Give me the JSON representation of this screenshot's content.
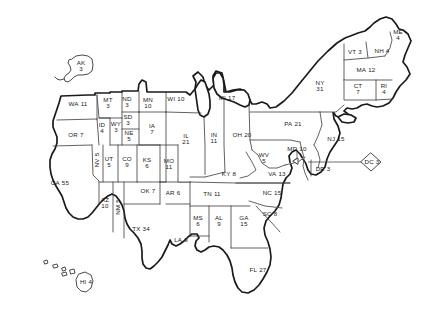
{
  "map": {
    "title": "United States Electoral Votes Map",
    "total_label": "",
    "background_color": "#ffffff",
    "outline_color": "#1a1a1a",
    "border_color": "#3a3a3a",
    "text_color": "#1a1a1a"
  },
  "chart_data": {
    "type": "map",
    "value_field": "electoral_votes",
    "regions": [
      {
        "abbr": "AK",
        "votes": 3,
        "x": 81,
        "y": 66,
        "orient": "stack",
        "inset": true
      },
      {
        "abbr": "HI",
        "votes": 4,
        "x": 86,
        "y": 282,
        "orient": "inline",
        "inset": true
      },
      {
        "abbr": "WA",
        "votes": 11,
        "x": 78,
        "y": 104,
        "orient": "inline",
        "inset": false
      },
      {
        "abbr": "OR",
        "votes": 7,
        "x": 76,
        "y": 135,
        "orient": "inline",
        "inset": false
      },
      {
        "abbr": "CA",
        "votes": 55,
        "x": 60,
        "y": 183,
        "orient": "inline",
        "inset": false
      },
      {
        "abbr": "ID",
        "votes": 4,
        "x": 102,
        "y": 128,
        "orient": "stack",
        "inset": false
      },
      {
        "abbr": "NV",
        "votes": 5,
        "x": 97,
        "y": 160,
        "orient": "inline",
        "inset": false,
        "vertical": true
      },
      {
        "abbr": "UT",
        "votes": 5,
        "x": 109,
        "y": 162,
        "orient": "stack",
        "inset": false
      },
      {
        "abbr": "AZ",
        "votes": 10,
        "x": 105,
        "y": 203,
        "orient": "stack",
        "inset": false
      },
      {
        "abbr": "MT",
        "votes": 3,
        "x": 108,
        "y": 103,
        "orient": "stack",
        "inset": false
      },
      {
        "abbr": "WY",
        "votes": 3,
        "x": 116,
        "y": 127,
        "orient": "stack",
        "inset": false
      },
      {
        "abbr": "CO",
        "votes": 9,
        "x": 127,
        "y": 162,
        "orient": "stack",
        "inset": false
      },
      {
        "abbr": "NM",
        "votes": 5,
        "x": 118,
        "y": 207,
        "orient": "inline",
        "inset": false,
        "vertical": true
      },
      {
        "abbr": "ND",
        "votes": 3,
        "x": 127,
        "y": 102,
        "orient": "stack",
        "inset": false
      },
      {
        "abbr": "SD",
        "votes": 3,
        "x": 128,
        "y": 120,
        "orient": "stack",
        "inset": false
      },
      {
        "abbr": "NE",
        "votes": 5,
        "x": 129,
        "y": 136,
        "orient": "stack",
        "inset": false
      },
      {
        "abbr": "KS",
        "votes": 6,
        "x": 147,
        "y": 163,
        "orient": "stack",
        "inset": false
      },
      {
        "abbr": "OK",
        "votes": 7,
        "x": 148,
        "y": 191,
        "orient": "inline",
        "inset": false
      },
      {
        "abbr": "TX",
        "votes": 34,
        "x": 141,
        "y": 229,
        "orient": "inline",
        "inset": false
      },
      {
        "abbr": "MN",
        "votes": 10,
        "x": 148,
        "y": 103,
        "orient": "stack",
        "inset": false
      },
      {
        "abbr": "IA",
        "votes": 7,
        "x": 152,
        "y": 129,
        "orient": "stack",
        "inset": false
      },
      {
        "abbr": "MO",
        "votes": 11,
        "x": 169,
        "y": 164,
        "orient": "stack",
        "inset": false
      },
      {
        "abbr": "AR",
        "votes": 6,
        "x": 173,
        "y": 193,
        "orient": "inline",
        "inset": false
      },
      {
        "abbr": "LA",
        "votes": 9,
        "x": 181,
        "y": 240,
        "orient": "inline",
        "inset": false
      },
      {
        "abbr": "WI",
        "votes": 10,
        "x": 176,
        "y": 99,
        "orient": "inline",
        "inset": false
      },
      {
        "abbr": "IL",
        "votes": 21,
        "x": 186,
        "y": 139,
        "orient": "stack",
        "inset": false
      },
      {
        "abbr": "MS",
        "votes": 6,
        "x": 198,
        "y": 221,
        "orient": "stack",
        "inset": false
      },
      {
        "abbr": "TN",
        "votes": 11,
        "x": 212,
        "y": 194,
        "orient": "inline",
        "inset": false
      },
      {
        "abbr": "MI",
        "votes": 17,
        "x": 227,
        "y": 98,
        "orient": "inline",
        "inset": false
      },
      {
        "abbr": "IN",
        "votes": 11,
        "x": 214,
        "y": 138,
        "orient": "stack",
        "inset": false
      },
      {
        "abbr": "KY",
        "votes": 8,
        "x": 229,
        "y": 174,
        "orient": "inline",
        "inset": false
      },
      {
        "abbr": "AL",
        "votes": 9,
        "x": 219,
        "y": 221,
        "orient": "stack",
        "inset": false
      },
      {
        "abbr": "OH",
        "votes": 20,
        "x": 242,
        "y": 135,
        "orient": "inline",
        "inset": false
      },
      {
        "abbr": "GA",
        "votes": 15,
        "x": 244,
        "y": 221,
        "orient": "stack",
        "inset": false
      },
      {
        "abbr": "WV",
        "votes": 5,
        "x": 264,
        "y": 158,
        "orient": "stack",
        "inset": false
      },
      {
        "abbr": "FL",
        "votes": 27,
        "x": 258,
        "y": 270,
        "orient": "inline",
        "inset": false
      },
      {
        "abbr": "SC",
        "votes": 8,
        "x": 270,
        "y": 214,
        "orient": "inline",
        "inset": false
      },
      {
        "abbr": "VA",
        "votes": 13,
        "x": 277,
        "y": 174,
        "orient": "inline",
        "inset": false
      },
      {
        "abbr": "NC",
        "votes": 15,
        "x": 272,
        "y": 193,
        "orient": "inline",
        "inset": false
      },
      {
        "abbr": "PA",
        "votes": 21,
        "x": 293,
        "y": 124,
        "orient": "inline",
        "inset": false
      },
      {
        "abbr": "MD",
        "votes": 10,
        "x": 297,
        "y": 149,
        "orient": "inline",
        "inset": false
      },
      {
        "abbr": "DE",
        "votes": 3,
        "x": 323,
        "y": 169,
        "orient": "inline",
        "inset": false
      },
      {
        "abbr": "NJ",
        "votes": 15,
        "x": 336,
        "y": 139,
        "orient": "inline",
        "inset": false
      },
      {
        "abbr": "NY",
        "votes": 31,
        "x": 320,
        "y": 86,
        "orient": "stack",
        "inset": false
      },
      {
        "abbr": "DC",
        "votes": 3,
        "x": 372,
        "y": 162,
        "orient": "inline",
        "inset": true
      },
      {
        "abbr": "VT",
        "votes": 3,
        "x": 355,
        "y": 52,
        "orient": "inline",
        "inset": false
      },
      {
        "abbr": "NH",
        "votes": 4,
        "x": 382,
        "y": 51,
        "orient": "inline",
        "inset": false
      },
      {
        "abbr": "ME",
        "votes": 4,
        "x": 398,
        "y": 35,
        "orient": "stack",
        "inset": false
      },
      {
        "abbr": "MA",
        "votes": 12,
        "x": 366,
        "y": 70,
        "orient": "inline",
        "inset": false
      },
      {
        "abbr": "CT",
        "votes": 7,
        "x": 358,
        "y": 89,
        "orient": "stack",
        "inset": false
      },
      {
        "abbr": "RI",
        "votes": 4,
        "x": 384,
        "y": 89,
        "orient": "stack",
        "inset": false
      }
    ]
  }
}
